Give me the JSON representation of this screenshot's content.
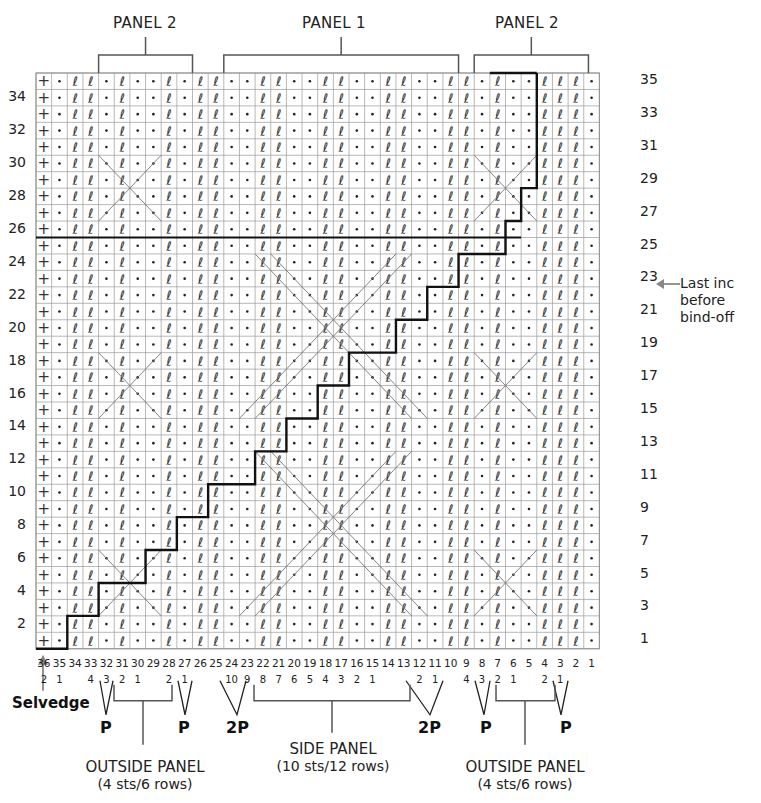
{
  "chart_data": {
    "type": "table",
    "columns": 36,
    "rows": 35,
    "column_labels": [
      "36",
      "35",
      "34",
      "33",
      "32",
      "31",
      "30",
      "29",
      "28",
      "27",
      "26",
      "25",
      "24",
      "23",
      "22",
      "21",
      "20",
      "19",
      "18",
      "17",
      "16",
      "15",
      "14",
      "13",
      "12",
      "11",
      "10",
      "9",
      "8",
      "7",
      "6",
      "5",
      "4",
      "3",
      "2",
      "1"
    ],
    "row_labels_left": [
      "2",
      "4",
      "6",
      "8",
      "10",
      "12",
      "14",
      "16",
      "18",
      "20",
      "22",
      "24",
      "26",
      "28",
      "30",
      "32",
      "34"
    ],
    "row_labels_right": [
      "1",
      "3",
      "5",
      "7",
      "9",
      "11",
      "13",
      "15",
      "17",
      "19",
      "21",
      "23",
      "25",
      "27",
      "29",
      "31",
      "33",
      "35"
    ],
    "panels_top": [
      {
        "label": "PANEL 2",
        "from_col": 32,
        "to_col": 27
      },
      {
        "label": "PANEL 1",
        "from_col": 24,
        "to_col": 11
      },
      {
        "label": "PANEL 2",
        "from_col": 8,
        "to_col": 3
      }
    ],
    "sub_numbering": [
      "2",
      "1",
      "",
      "4",
      "3",
      "2",
      "1",
      "",
      "2",
      "1",
      "",
      "",
      "10",
      "9",
      "8",
      "7",
      "6",
      "5",
      "4",
      "3",
      "2",
      "1",
      "",
      "",
      "2",
      "1",
      "",
      "4",
      "3",
      "2",
      "1",
      "",
      "2",
      "1"
    ],
    "purl_markers": [
      {
        "label": "P",
        "between": "34-33"
      },
      {
        "label": "P",
        "between": "29-28"
      },
      {
        "label": "2P",
        "between": "26-24"
      },
      {
        "label": "2P",
        "between": "14-12"
      },
      {
        "label": "P",
        "between": "10-9"
      },
      {
        "label": "P",
        "between": "5-4"
      }
    ],
    "bottom_groups": [
      {
        "label": "OUTSIDE PANEL",
        "sub": "(4 sts/6 rows)"
      },
      {
        "label": "SIDE PANEL",
        "sub": "(10 sts/12 rows)"
      },
      {
        "label": "OUTSIDE PANEL",
        "sub": "(4 sts/6 rows)"
      }
    ],
    "symbols": {
      "selvedge": "+",
      "purl": "•",
      "twisted_knit": "ℓ",
      "cable_cross": "diagonal lines"
    },
    "annotations": [
      {
        "text": "Last inc before bind-off",
        "row": 25
      },
      {
        "text": "Selvedge",
        "col": 36
      }
    ]
  },
  "labels": {
    "panel2_left": "PANEL 2",
    "panel1": "PANEL 1",
    "panel2_right": "PANEL 2",
    "selvedge": "Selvedge",
    "last_inc_1": "Last inc",
    "last_inc_2": "before",
    "last_inc_3": "bind-off",
    "outside_left": "OUTSIDE PANEL",
    "outside_left_sub": "(4 sts/6 rows)",
    "side": "SIDE PANEL",
    "side_sub": "(10 sts/12 rows)",
    "outside_right": "OUTSIDE PANEL",
    "outside_right_sub": "(4 sts/6 rows)",
    "p1": "P",
    "p2": "P",
    "p3": "2P",
    "p4": "2P",
    "p5": "P",
    "p6": "P"
  }
}
